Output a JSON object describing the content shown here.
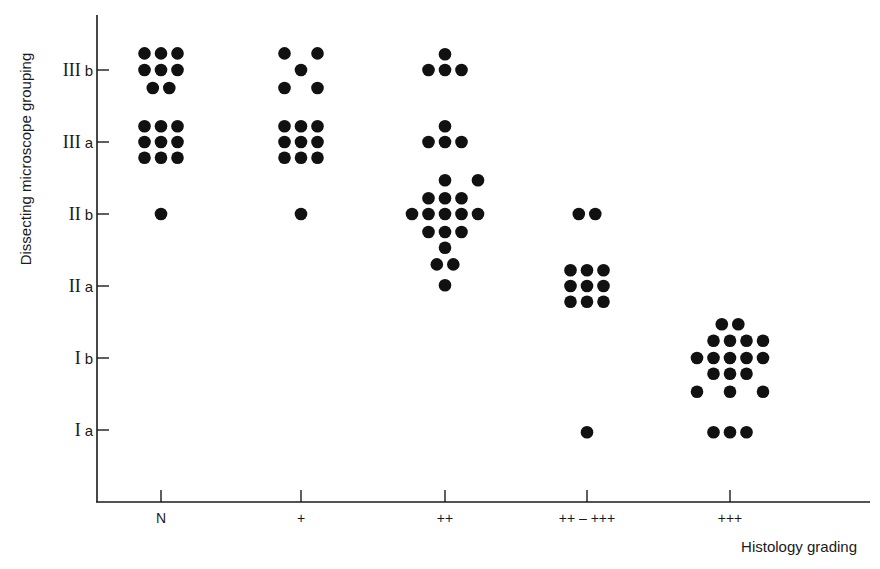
{
  "chart_data": {
    "type": "scatter",
    "title": "",
    "xlabel": "Histology grading",
    "ylabel": "Dissecting microscope grouping",
    "categories": [
      "N",
      "+",
      "++",
      "++-+++",
      "+++"
    ],
    "x_tick_labels": [
      "N",
      "+",
      "++",
      "++ – +++",
      "+++"
    ],
    "y_levels": [
      "I a",
      "I b",
      "II a",
      "II b",
      "III a",
      "III b"
    ],
    "y_tick_labels": [
      {
        "roman": "I",
        "suffix": "a"
      },
      {
        "roman": "I",
        "suffix": "b"
      },
      {
        "roman": "II",
        "suffix": "a"
      },
      {
        "roman": "II",
        "suffix": "b"
      },
      {
        "roman": "III",
        "suffix": "a"
      },
      {
        "roman": "III",
        "suffix": "b"
      }
    ],
    "ylim": [
      0,
      7
    ],
    "grid": false,
    "legend": "none",
    "marker_color": "#111111",
    "note": "Each dot is one case; dots are jittered horizontally around the category and vertically around the grade level (y: 1 = I a ... 6 = III b).",
    "counts": [
      {
        "category": "N",
        "III b": 8,
        "III a": 9,
        "II b": 1
      },
      {
        "category": "+",
        "III b": 5,
        "III a": 9,
        "II b": 1
      },
      {
        "category": "++",
        "III b": 4,
        "III a": 4,
        "II b": 17
      },
      {
        "category": "++-+++",
        "II b": 2,
        "II a": 9,
        "I a": 1
      },
      {
        "category": "+++",
        "I b": 17,
        "I a": 3
      }
    ],
    "series": [
      {
        "name": "N",
        "points": [
          {
            "dx": -1,
            "y": 6.23
          },
          {
            "dx": 0,
            "y": 6.23
          },
          {
            "dx": 1,
            "y": 6.23
          },
          {
            "dx": -1,
            "y": 6.0
          },
          {
            "dx": 0,
            "y": 6.0
          },
          {
            "dx": 1,
            "y": 6.0
          },
          {
            "dx": -0.5,
            "y": 5.75
          },
          {
            "dx": 0.5,
            "y": 5.75
          },
          {
            "dx": -1,
            "y": 5.22
          },
          {
            "dx": 0,
            "y": 5.22
          },
          {
            "dx": 1,
            "y": 5.22
          },
          {
            "dx": -1,
            "y": 5.0
          },
          {
            "dx": 0,
            "y": 5.0
          },
          {
            "dx": 1,
            "y": 5.0
          },
          {
            "dx": -1,
            "y": 4.78
          },
          {
            "dx": 0,
            "y": 4.78
          },
          {
            "dx": 1,
            "y": 4.78
          },
          {
            "dx": 0,
            "y": 4.0
          }
        ]
      },
      {
        "name": "+",
        "points": [
          {
            "dx": -1,
            "y": 6.23
          },
          {
            "dx": 1,
            "y": 6.23
          },
          {
            "dx": 0,
            "y": 6.0
          },
          {
            "dx": -1,
            "y": 5.75
          },
          {
            "dx": 1,
            "y": 5.75
          },
          {
            "dx": -1,
            "y": 5.22
          },
          {
            "dx": 0,
            "y": 5.22
          },
          {
            "dx": 1,
            "y": 5.22
          },
          {
            "dx": -1,
            "y": 5.0
          },
          {
            "dx": 0,
            "y": 5.0
          },
          {
            "dx": 1,
            "y": 5.0
          },
          {
            "dx": -1,
            "y": 4.78
          },
          {
            "dx": 0,
            "y": 4.78
          },
          {
            "dx": 1,
            "y": 4.78
          },
          {
            "dx": 0,
            "y": 4.0
          }
        ]
      },
      {
        "name": "++",
        "points": [
          {
            "dx": 0,
            "y": 6.22
          },
          {
            "dx": -1,
            "y": 6.0
          },
          {
            "dx": 0,
            "y": 6.0
          },
          {
            "dx": 1,
            "y": 6.0
          },
          {
            "dx": 0,
            "y": 5.22
          },
          {
            "dx": -1,
            "y": 5.0
          },
          {
            "dx": 0,
            "y": 5.0
          },
          {
            "dx": 1,
            "y": 5.0
          },
          {
            "dx": 0,
            "y": 4.47
          },
          {
            "dx": 2,
            "y": 4.47
          },
          {
            "dx": -1,
            "y": 4.22
          },
          {
            "dx": 0,
            "y": 4.22
          },
          {
            "dx": 1,
            "y": 4.22
          },
          {
            "dx": -2,
            "y": 4.0
          },
          {
            "dx": -1,
            "y": 4.0
          },
          {
            "dx": 0,
            "y": 4.0
          },
          {
            "dx": 1,
            "y": 4.0
          },
          {
            "dx": 2,
            "y": 4.0
          },
          {
            "dx": -1,
            "y": 3.75
          },
          {
            "dx": 0,
            "y": 3.75
          },
          {
            "dx": 1,
            "y": 3.75
          },
          {
            "dx": 0,
            "y": 3.53
          },
          {
            "dx": -0.5,
            "y": 3.3
          },
          {
            "dx": 0.5,
            "y": 3.3
          },
          {
            "dx": 0,
            "y": 3.01
          }
        ]
      },
      {
        "name": "++-+++",
        "points": [
          {
            "dx": -0.5,
            "y": 4.0
          },
          {
            "dx": 0.5,
            "y": 4.0
          },
          {
            "dx": -1,
            "y": 3.22
          },
          {
            "dx": 0,
            "y": 3.22
          },
          {
            "dx": 1,
            "y": 3.22
          },
          {
            "dx": -1,
            "y": 3.0
          },
          {
            "dx": 0,
            "y": 3.0
          },
          {
            "dx": 1,
            "y": 3.0
          },
          {
            "dx": -1,
            "y": 2.78
          },
          {
            "dx": 0,
            "y": 2.78
          },
          {
            "dx": 1,
            "y": 2.78
          },
          {
            "dx": 0,
            "y": 0.97
          }
        ]
      },
      {
        "name": "+++",
        "points": [
          {
            "dx": -0.5,
            "y": 2.47
          },
          {
            "dx": 0.5,
            "y": 2.47
          },
          {
            "dx": -1,
            "y": 2.24
          },
          {
            "dx": 0,
            "y": 2.24
          },
          {
            "dx": 1,
            "y": 2.24
          },
          {
            "dx": 2,
            "y": 2.24
          },
          {
            "dx": -2,
            "y": 2.0
          },
          {
            "dx": -1,
            "y": 2.0
          },
          {
            "dx": 0,
            "y": 2.0
          },
          {
            "dx": 1,
            "y": 2.0
          },
          {
            "dx": 2,
            "y": 2.0
          },
          {
            "dx": -1,
            "y": 1.78
          },
          {
            "dx": 0,
            "y": 1.78
          },
          {
            "dx": 1,
            "y": 1.78
          },
          {
            "dx": -2,
            "y": 1.53
          },
          {
            "dx": 0,
            "y": 1.53
          },
          {
            "dx": 2,
            "y": 1.53
          },
          {
            "dx": -1,
            "y": 0.97
          },
          {
            "dx": 0,
            "y": 0.97
          },
          {
            "dx": 1,
            "y": 0.97
          }
        ]
      }
    ]
  }
}
